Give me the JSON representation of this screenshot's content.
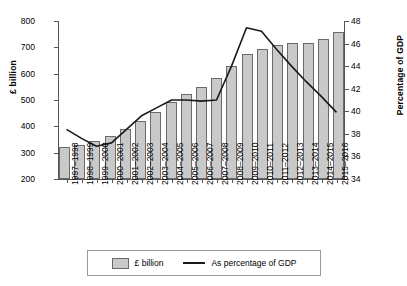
{
  "chart_data": {
    "type": "bar",
    "title": "",
    "xlabel": "",
    "ylabel": "£ billion",
    "y2label": "Percentage of GDP",
    "ylim": [
      200,
      800
    ],
    "y2lim": [
      34,
      48
    ],
    "yticks": [
      200,
      300,
      400,
      500,
      600,
      700,
      800
    ],
    "y2ticks": [
      34,
      36,
      38,
      40,
      42,
      44,
      46,
      48
    ],
    "grid": false,
    "legend_position": "bottom",
    "categories": [
      "1997–1998",
      "1998–1999",
      "1999–2000",
      "2000–2001",
      "2001–2002",
      "2002–2003",
      "2003–2004",
      "2004–2005",
      "2005–2006",
      "2006–2007",
      "2007–2008",
      "2008–2009",
      "2009–2010",
      "2010–2011",
      "2011–2012",
      "2012–2013",
      "2013–2014",
      "2014–2015",
      "2015–2016"
    ],
    "series": [
      {
        "name": "£ billion",
        "type": "bar",
        "axis": "left",
        "values": [
          322,
          331,
          343,
          363,
          391,
          421,
          455,
          493,
          523,
          551,
          583,
          629,
          673,
          692,
          710,
          715,
          718,
          733,
          760
        ]
      },
      {
        "name": "As percentage of GDP",
        "type": "line",
        "axis": "right",
        "values": [
          38.4,
          37.6,
          36.9,
          37.2,
          38.4,
          39.6,
          40.3,
          41.0,
          41.0,
          40.9,
          41.0,
          44.0,
          47.4,
          47.1,
          45.5,
          44.0,
          42.6,
          41.3,
          39.9
        ]
      }
    ]
  },
  "legend": {
    "bars_label": "£ billion",
    "line_label": "As percentage of GDP"
  }
}
